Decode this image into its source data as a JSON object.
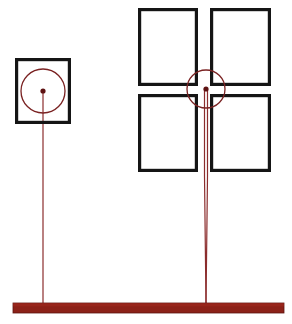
{
  "scene": {
    "title": "Target assemblies on mounting rail",
    "canvas": {
      "width": 292,
      "height": 324
    },
    "background_color": "#ffffff",
    "frame_color": "#151515",
    "marker_color": "#7a2222",
    "stem_color": "#8b2d2d",
    "base_color": "#8c2118",
    "base_edge_color": "#5e1610"
  },
  "base_rail": {
    "label": "mounting rail",
    "x": 13,
    "y": 303,
    "width": 271,
    "height": 10,
    "color": "#8c2118"
  },
  "assemblies": [
    {
      "id": "left-assembly",
      "label": "single-pane target",
      "panes": [
        {
          "id": "left-pane-1",
          "x": 15,
          "y": 58,
          "width": 56,
          "height": 66
        }
      ],
      "marker": {
        "circle_cx": 43,
        "circle_cy": 91,
        "circle_r": 22,
        "dot_cx": 43,
        "dot_cy": 91,
        "dot_r": 2.6
      },
      "stem": {
        "x": 43,
        "y_top": 91,
        "y_bottom": 304,
        "width": 1.2,
        "double": false
      }
    },
    {
      "id": "right-assembly",
      "label": "four-pane target",
      "panes": [
        {
          "id": "right-pane-top-left",
          "x": 138,
          "y": 8,
          "width": 60,
          "height": 78
        },
        {
          "id": "right-pane-top-right",
          "x": 210,
          "y": 8,
          "width": 61,
          "height": 78
        },
        {
          "id": "right-pane-bottom-left",
          "x": 138,
          "y": 94,
          "width": 60,
          "height": 78
        },
        {
          "id": "right-pane-bottom-right",
          "x": 210,
          "y": 94,
          "width": 61,
          "height": 78
        }
      ],
      "marker": {
        "circle_cx": 206,
        "circle_cy": 89,
        "circle_r": 19,
        "dot_cx": 206,
        "dot_cy": 89,
        "dot_r": 2.6
      },
      "stem": {
        "x": 206,
        "y_top": 89,
        "y_bottom": 304,
        "width": 1.2,
        "double": true,
        "double_gap": 3.0,
        "double_merge_y": 176
      }
    }
  ]
}
